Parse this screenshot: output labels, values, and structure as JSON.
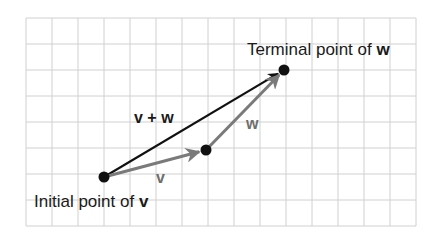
{
  "diagram": {
    "grid": {
      "x0": 26,
      "y0": 18,
      "cell": 26,
      "cols": 15,
      "rows": 8,
      "color": "#d0d0d0"
    },
    "points": {
      "initial": {
        "x": 104,
        "y": 177
      },
      "middle": {
        "x": 206,
        "y": 150
      },
      "terminal": {
        "x": 284,
        "y": 70
      }
    },
    "vectors": [
      {
        "name": "v",
        "from": "initial",
        "to": "middle",
        "color": "#7a7a7a"
      },
      {
        "name": "w",
        "from": "middle",
        "to": "terminal",
        "color": "#7a7a7a"
      },
      {
        "name": "v + w",
        "from": "initial",
        "to": "terminal",
        "color": "#111111"
      }
    ],
    "labels": {
      "sum": "v + w",
      "v": "v",
      "w": "w",
      "initial_text": "Initial point of ",
      "initial_bold": "v",
      "terminal_text": "Terminal point of ",
      "terminal_bold": "w"
    },
    "colors": {
      "point": "#111111",
      "component_vector": "#7a7a7a",
      "resultant_vector": "#111111",
      "component_label": "#6e6e6e",
      "resultant_label": "#1a1a1a"
    }
  }
}
